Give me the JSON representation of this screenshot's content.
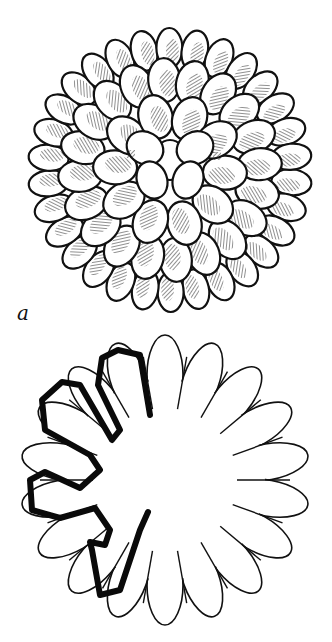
{
  "figure": {
    "panels": [
      {
        "id": "a",
        "label": "a",
        "description": "Surface view of spherical particle composed of clustered oval subunits with hatched shading"
      },
      {
        "id": "b",
        "label": "b",
        "description": "Cross-section outline with scalloped lobes; thick black trace follows inner contour of left lobes"
      }
    ]
  },
  "colors": {
    "ink": "#111111",
    "background": "#ffffff"
  }
}
